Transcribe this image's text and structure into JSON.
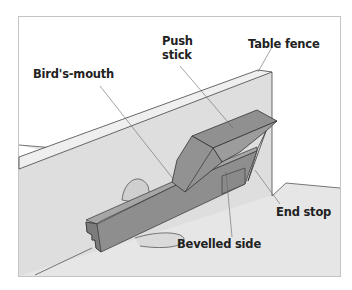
{
  "diagram": {
    "labels": {
      "push_stick": "Push\nstick",
      "push_stick_line1": "Push",
      "push_stick_line2": "stick",
      "table_fence": "Table fence",
      "birds_mouth": "Bird's-mouth",
      "end_stop": "End stop",
      "bevelled_side": "Bevelled side"
    },
    "colors": {
      "frame": "#bdbdbd",
      "table": "#e6e6e6",
      "fence_face": "#dcdcdc",
      "fence_top": "#ececec",
      "workpiece_front": "#8a8a8a",
      "workpiece_top": "#a2a2a2",
      "push_stick_top": "#8c8c8c",
      "push_stick_side": "#9a9a9a",
      "blade": "#c8c8c8",
      "leader": "#666666",
      "text": "#222222"
    }
  }
}
